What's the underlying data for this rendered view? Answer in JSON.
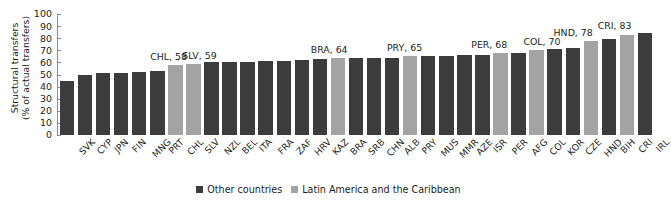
{
  "chart_data": {
    "type": "bar",
    "title": "",
    "xlabel": "",
    "ylabel": "Structural transfers (% of actual transfers)",
    "ylabel_line1": "Structural transfers",
    "ylabel_line2": "(% of actual transfers)",
    "ylim": [
      0,
      100
    ],
    "yticks": [
      0,
      10,
      20,
      30,
      40,
      50,
      60,
      70,
      80,
      90,
      100
    ],
    "grid": false,
    "legend_position": "bottom-center",
    "categories": [
      "SVK",
      "CYP",
      "JPN",
      "FIN",
      "MNG",
      "PRT",
      "CHL",
      "SLV",
      "NZL",
      "BEL",
      "ITA",
      "FRA",
      "ZAF",
      "HRV",
      "KAZ",
      "BRA",
      "SRB",
      "CHN",
      "ALB",
      "PRY",
      "MUS",
      "MMR",
      "AZE",
      "ISR",
      "PER",
      "AFG",
      "COL",
      "KOR",
      "CZE",
      "HND",
      "BIH",
      "CRI",
      "IRL"
    ],
    "values": [
      45,
      50,
      51,
      51,
      52,
      53,
      58,
      59,
      60,
      60,
      60,
      61,
      61,
      62,
      63,
      64,
      64,
      64,
      64,
      65,
      65,
      65,
      66,
      66,
      68,
      68,
      70,
      71,
      72,
      78,
      79,
      83,
      84
    ],
    "groups": [
      "other",
      "other",
      "other",
      "other",
      "other",
      "other",
      "lac",
      "lac",
      "other",
      "other",
      "other",
      "other",
      "other",
      "other",
      "other",
      "lac",
      "other",
      "other",
      "other",
      "lac",
      "other",
      "other",
      "other",
      "other",
      "lac",
      "other",
      "lac",
      "other",
      "other",
      "lac",
      "other",
      "lac",
      "other"
    ],
    "series": [
      {
        "name": "Other countries",
        "color": "#3c3c3c"
      },
      {
        "name": "Latin America and the Caribbean",
        "color": "#a3a3a3"
      }
    ],
    "annotations": [
      {
        "label": "CHL, 58",
        "category": "CHL",
        "value": 58
      },
      {
        "label": "SLV, 59",
        "category": "SLV",
        "value": 59
      },
      {
        "label": "BRA, 64",
        "category": "BRA",
        "value": 64
      },
      {
        "label": "PRY, 65",
        "category": "PRY",
        "value": 65
      },
      {
        "label": "PER, 68",
        "category": "PER",
        "value": 68
      },
      {
        "label": "COL, 70",
        "category": "COL",
        "value": 70
      },
      {
        "label": "HND, 78",
        "category": "HND",
        "value": 78
      },
      {
        "label": "CRI, 83",
        "category": "CRI",
        "value": 83
      }
    ]
  },
  "legend": {
    "items": [
      {
        "label": "Other countries",
        "color": "#3c3c3c"
      },
      {
        "label": "Latin America and the Caribbean",
        "color": "#a3a3a3"
      }
    ]
  },
  "colors": {
    "other": "#3c3c3c",
    "lac": "#a3a3a3",
    "axis": "#8d8d8d",
    "text": "#231f20",
    "background": "#ffffff"
  }
}
